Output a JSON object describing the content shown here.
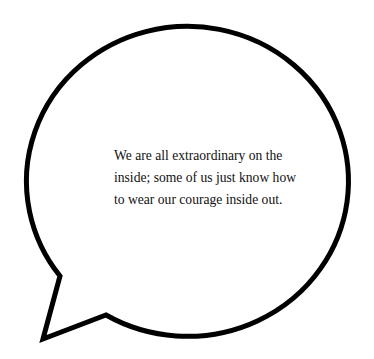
{
  "speech_bubble": {
    "stroke_color": "#000000",
    "fill_color": "#ffffff",
    "quote_lines": [
      "We are all extraordinary on the",
      "inside; some of us just know how",
      "to wear our courage inside out."
    ]
  }
}
